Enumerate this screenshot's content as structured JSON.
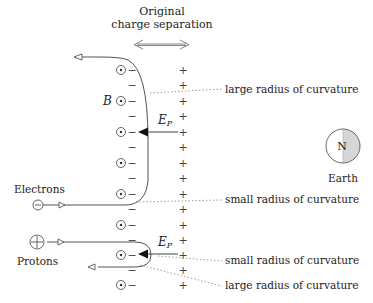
{
  "title": {
    "line1": "Original",
    "line2": "charge separation"
  },
  "labels": {
    "b_field": "B",
    "e_field_top": "E",
    "e_field_top_sub": "P",
    "e_field_bottom": "E",
    "e_field_bottom_sub": "P",
    "electrons": "Electrons",
    "protons": "Protons",
    "earth": "Earth",
    "earth_north": "N",
    "annot_large_top": "large radius of curvature",
    "annot_small_top": "small radius of curvature",
    "annot_small_bottom": "small radius of curvature",
    "annot_large_bottom": "large radius of curvature"
  },
  "symbols": {
    "minus": "−",
    "plus": "+",
    "electron_charge": "−",
    "proton_charge": "+"
  },
  "icons": {
    "b_field_out_of_page": "circled-dot-icon",
    "earth": "half-shaded-circle-icon",
    "double_arrow": "left-right-arrow-icon"
  },
  "colors": {
    "line": "#555555",
    "dotted": "#888888",
    "earth_shade": "#d6d6d6",
    "text": "#222222"
  }
}
